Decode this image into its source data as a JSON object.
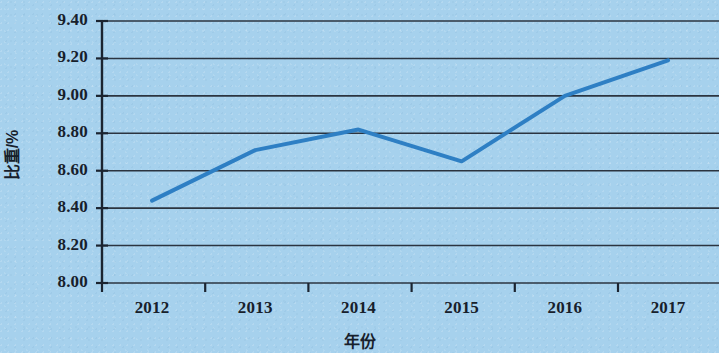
{
  "chart_data": {
    "type": "line",
    "title": "",
    "subtitle": "",
    "xlabel": "年份",
    "ylabel": "比重/%",
    "categories": [
      "2012",
      "2013",
      "2014",
      "2015",
      "2016",
      "2017"
    ],
    "values": [
      8.44,
      8.71,
      8.82,
      8.65,
      9.0,
      9.19
    ],
    "series": [
      {
        "name": "比重/%",
        "values": [
          8.44,
          8.71,
          8.82,
          8.65,
          9.0,
          9.19
        ],
        "color": "#2e7fc4"
      }
    ],
    "ylim": [
      8.0,
      9.4
    ],
    "ytick_values": [
      8.0,
      8.2,
      8.4,
      8.6,
      8.8,
      9.0,
      9.2,
      9.4
    ],
    "ytick_labels": [
      "8.00",
      "8.20",
      "8.40",
      "8.60",
      "8.80",
      "9.00",
      "9.20",
      "9.40"
    ],
    "xtick_labels": [
      "2012",
      "2013",
      "2014",
      "2015",
      "2016",
      "2017"
    ],
    "grid": true,
    "grid_axis": "y",
    "legend": false,
    "legend_position": "none",
    "markers": false,
    "line_width": 4,
    "background_color": "#a6d1ed",
    "grid_color": "#2b3440",
    "axis_color": "#1b2430"
  },
  "axes": {
    "y_title": "比重/%",
    "x_title": "年份"
  }
}
